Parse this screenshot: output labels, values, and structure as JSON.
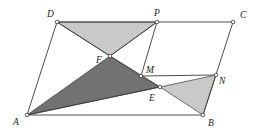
{
  "figure": {
    "type": "geometry-parallelogram",
    "colors": {
      "light_fill": "#c9c9c9",
      "dark_fill": "#727272",
      "line": "#3a3a3a"
    },
    "points": {
      "A": {
        "label": "A",
        "x": 27,
        "y": 115
      },
      "B": {
        "label": "B",
        "x": 203,
        "y": 115
      },
      "C": {
        "label": "C",
        "x": 233,
        "y": 22
      },
      "D": {
        "label": "D",
        "x": 57,
        "y": 22
      },
      "P": {
        "label": "P",
        "x": 157,
        "y": 22
      },
      "F": {
        "label": "F",
        "x": 110,
        "y": 56
      },
      "M": {
        "label": "M",
        "x": 141,
        "y": 76
      },
      "N": {
        "label": "N",
        "x": 216,
        "y": 75
      },
      "E": {
        "label": "E",
        "x": 160,
        "y": 87
      }
    },
    "shaded_regions": [
      {
        "name": "triangle-DPF",
        "vertices": [
          "D",
          "P",
          "F"
        ],
        "shade": "light"
      },
      {
        "name": "triangle-AFE",
        "vertices": [
          "A",
          "F",
          "M",
          "E"
        ],
        "shade": "dark"
      },
      {
        "name": "triangle-ENB",
        "vertices": [
          "E",
          "N",
          "B"
        ],
        "shade": "light"
      }
    ],
    "segments": [
      [
        "A",
        "B"
      ],
      [
        "B",
        "C"
      ],
      [
        "C",
        "D"
      ],
      [
        "D",
        "A"
      ],
      [
        "P",
        "M"
      ],
      [
        "M",
        "N"
      ],
      [
        "D",
        "F"
      ],
      [
        "F",
        "E"
      ],
      [
        "A",
        "E"
      ]
    ]
  }
}
